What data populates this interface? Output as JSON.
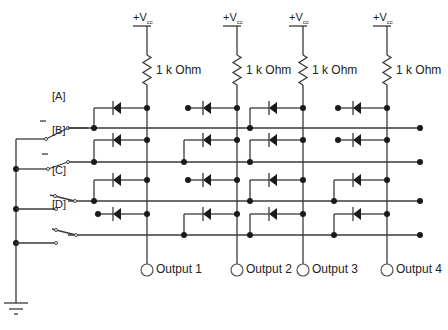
{
  "diagram": {
    "supply": {
      "label": "+V",
      "subscript": "cc"
    },
    "resistor_label": "1 k Ohm",
    "columns": [
      {
        "x": 147,
        "output_label": "Output 1"
      },
      {
        "x": 237,
        "output_label": "Output 2"
      },
      {
        "x": 303,
        "output_label": "Output 3"
      },
      {
        "x": 387,
        "output_label": "Output 4"
      }
    ],
    "rows": [
      {
        "label": "[A]",
        "diode_y": 108,
        "bus_y": 128
      },
      {
        "label": "[B]",
        "diode_y": 140,
        "bus_y": 162
      },
      {
        "label": "[C]",
        "diode_y": 180,
        "bus_y": 201
      },
      {
        "label": "[D]",
        "diode_y": 214,
        "bus_y": 235
      }
    ],
    "diode_matrix": [
      [
        1,
        0,
        1,
        0
      ],
      [
        1,
        1,
        1,
        0
      ],
      [
        1,
        0,
        1,
        1
      ],
      [
        0,
        1,
        1,
        1
      ]
    ],
    "ground_label": "ground"
  }
}
